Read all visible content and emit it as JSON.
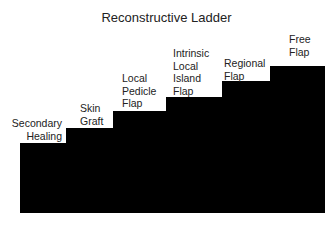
{
  "title": "Reconstructive Ladder",
  "steps": [
    {
      "label": "Secondary\nHealing"
    },
    {
      "label": "Skin\nGraft"
    },
    {
      "label": "Local\nPedicle\nFlap"
    },
    {
      "label": "Intrinsic\nLocal\nIsland\nFlap"
    },
    {
      "label": "Regional\nFlap"
    },
    {
      "label": "Free\nFlap"
    }
  ],
  "colors": {
    "steps": "#000000",
    "background": "#ffffff"
  }
}
